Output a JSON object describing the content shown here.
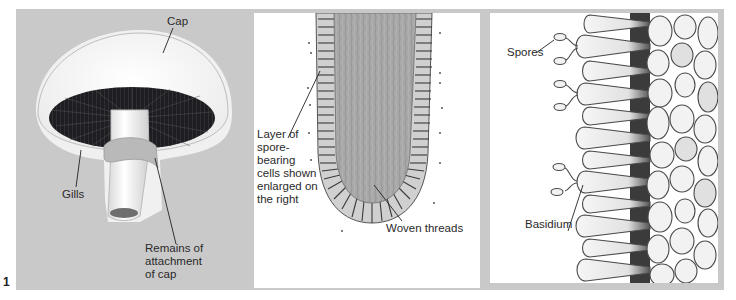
{
  "figure": {
    "number": "1",
    "background_gray": "#c9c9c9",
    "panels": [
      {
        "id": "mushroom",
        "title": "Mushroom (whole)",
        "labels": {
          "cap": "Cap",
          "gills": "Gills",
          "remains": "Remains of\nattachment\nof cap"
        }
      },
      {
        "id": "gill-section",
        "title": "Gill cross-section",
        "labels": {
          "layer": "Layer of\nspore-\nbearing\ncells shown\nenlarged on\nthe right",
          "woven": "Woven threads"
        }
      },
      {
        "id": "basidium-detail",
        "title": "Spore-bearing cells enlarged",
        "labels": {
          "spores": "Spores",
          "basidium": "Basidium"
        }
      }
    ]
  }
}
